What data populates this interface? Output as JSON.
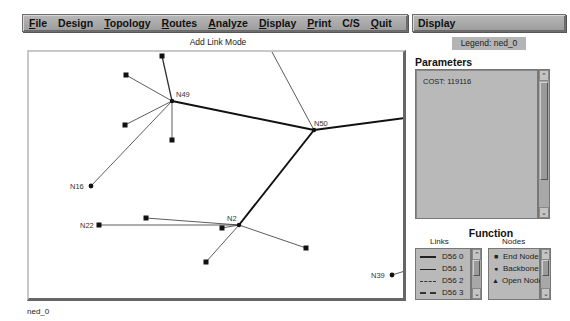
{
  "menubar": {
    "items": [
      {
        "label": "File",
        "mnemonic": "F",
        "rest": "ile"
      },
      {
        "label": "Design",
        "mnemonic": "",
        "rest": "Design"
      },
      {
        "label": "Topology",
        "mnemonic": "T",
        "rest": "opology"
      },
      {
        "label": "Routes",
        "mnemonic": "R",
        "rest": "outes"
      },
      {
        "label": "Analyze",
        "mnemonic": "A",
        "rest": "nalyze"
      },
      {
        "label": "Display",
        "mnemonic": "D",
        "rest": "isplay"
      },
      {
        "label": "Print",
        "mnemonic": "P",
        "rest": "rint"
      },
      {
        "label": "C/S",
        "mnemonic": "",
        "rest": "C/S"
      },
      {
        "label": "Quit",
        "mnemonic": "Q",
        "rest": "uit"
      }
    ]
  },
  "display_panel": {
    "title": "Display",
    "legend_badge": "Legend: ned_0",
    "parameters": {
      "title": "Parameters",
      "content": "COST: 119116"
    },
    "function": {
      "title": "Function",
      "links": {
        "label": "Links",
        "items": [
          {
            "label": "D56 0",
            "style": "thick"
          },
          {
            "label": "D56 1",
            "style": "thin"
          },
          {
            "label": "D56 2",
            "style": "dash"
          },
          {
            "label": "D56 3",
            "style": "dash2"
          }
        ]
      },
      "nodes": {
        "label": "Nodes",
        "items": [
          {
            "label": "End Node",
            "symbol": "■"
          },
          {
            "label": "Backbone",
            "symbol": "●"
          },
          {
            "label": "Open Node",
            "symbol": "▲"
          }
        ]
      }
    }
  },
  "canvas": {
    "mode_label": "Add Link Mode",
    "labeled_nodes": [
      {
        "id": "N49",
        "type": "backbone"
      },
      {
        "id": "N50",
        "type": "backbone"
      },
      {
        "id": "N2",
        "type": "backbone"
      },
      {
        "id": "N16",
        "type": "backbone"
      },
      {
        "id": "N22",
        "type": "end"
      },
      {
        "id": "N39",
        "type": "backbone"
      }
    ]
  },
  "status_bar": {
    "text": "ned_0"
  },
  "colors": {
    "menubar_bg": "#a8a8a8",
    "panel_bg": "#b9b9b9",
    "canvas_bg": "#ffffff",
    "link_color": "#111111"
  }
}
